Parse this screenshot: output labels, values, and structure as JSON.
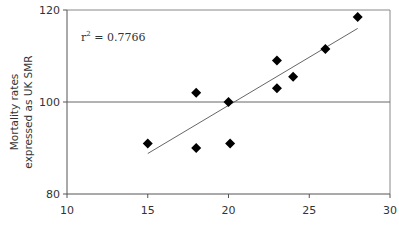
{
  "chart_data": {
    "type": "scatter",
    "title": "",
    "xlabel": "",
    "ylabel_lines": [
      "Mortality rates",
      "expressed as UK SMR"
    ],
    "ylabel": "Mortality rates expressed as UK SMR",
    "xlim": [
      10,
      30
    ],
    "ylim": [
      80,
      120
    ],
    "x_ticks": [
      10,
      15,
      20,
      25,
      30
    ],
    "y_ticks": [
      80,
      100,
      120
    ],
    "grid": false,
    "reference_line": {
      "y": 100
    },
    "annotation": {
      "text": "r",
      "superscript": "2",
      "rest": " = 0.7766",
      "full": "r² = 0.7766"
    },
    "series": [
      {
        "name": "Points",
        "marker": "diamond",
        "points": [
          {
            "x": 15,
            "y": 91
          },
          {
            "x": 18,
            "y": 90
          },
          {
            "x": 18,
            "y": 102
          },
          {
            "x": 20,
            "y": 100
          },
          {
            "x": 20.1,
            "y": 91
          },
          {
            "x": 23,
            "y": 109
          },
          {
            "x": 23,
            "y": 103
          },
          {
            "x": 24,
            "y": 105.5
          },
          {
            "x": 26,
            "y": 111.5
          },
          {
            "x": 28,
            "y": 118.5
          }
        ]
      }
    ],
    "trendline": {
      "type": "linear",
      "from": {
        "x": 15,
        "y": 88.8
      },
      "to": {
        "x": 28,
        "y": 116
      }
    }
  },
  "labels": {
    "x_ticks": [
      "10",
      "15",
      "20",
      "25",
      "30"
    ],
    "y_ticks": [
      "80",
      "100",
      "120"
    ],
    "ylabel_line1": "Mortality rates",
    "ylabel_line2": "expressed as UK SMR",
    "r2_base": "r",
    "r2_sup": "2",
    "r2_value": " = 0.7766"
  },
  "colors": {
    "axis": "#555555",
    "marker": "#000000",
    "trendline": "#666666"
  }
}
